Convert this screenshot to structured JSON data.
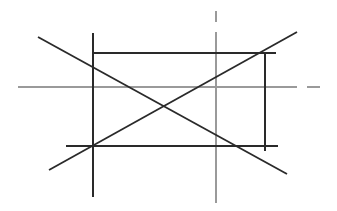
{
  "diagram": {
    "title": "Geometric construction: rectangle with diagonals and center axes",
    "colors": {
      "background": "#ffffff",
      "construction_line": "#2a2a2a",
      "axis_line": "#9a9a9a"
    },
    "axes": {
      "horizontal": {
        "y": 87,
        "x1": 18,
        "x2": 297,
        "dash": {
          "x1": 307,
          "x2": 320
        }
      },
      "vertical": {
        "x": 216,
        "y1": 32,
        "y2": 203,
        "dash": {
          "y1": 11,
          "y2": 22
        }
      }
    },
    "rectangle_lines": [
      {
        "name": "left-vertical",
        "x1": 93,
        "y1": 33,
        "x2": 93,
        "y2": 197
      },
      {
        "name": "top-horizontal",
        "x1": 93,
        "y1": 53,
        "x2": 276,
        "y2": 53
      },
      {
        "name": "right-vertical",
        "x1": 265,
        "y1": 53,
        "x2": 265,
        "y2": 151
      },
      {
        "name": "bottom-horizontal",
        "x1": 66,
        "y1": 146,
        "x2": 278,
        "y2": 146
      }
    ],
    "diagonals": [
      {
        "name": "descending-diagonal",
        "x1": 38,
        "y1": 37,
        "x2": 287,
        "y2": 174
      },
      {
        "name": "ascending-diagonal",
        "x1": 49,
        "y1": 170,
        "x2": 297,
        "y2": 32
      }
    ],
    "center_point": {
      "x": 216,
      "y": 87
    }
  }
}
